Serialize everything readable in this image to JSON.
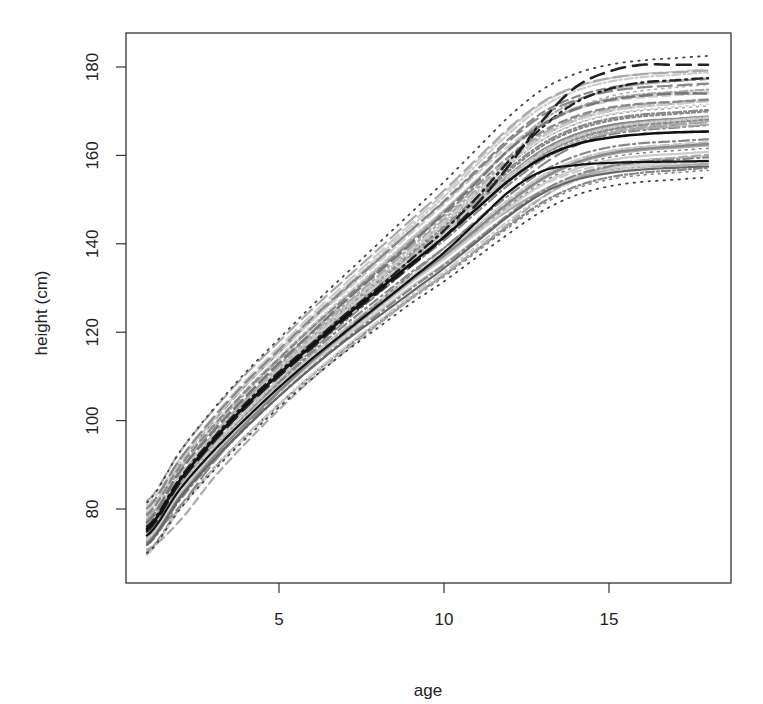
{
  "chart_data": {
    "type": "line",
    "title": "",
    "xlabel": "age",
    "ylabel": "height (cm)",
    "xlim": [
      0.3,
      18.7
    ],
    "ylim": [
      63,
      187
    ],
    "x_ticks": [
      5,
      10,
      15
    ],
    "y_ticks": [
      80,
      100,
      120,
      140,
      160,
      180
    ],
    "x_tick_labels": [
      "5",
      "10",
      "15"
    ],
    "y_tick_labels": [
      "80",
      "100",
      "120",
      "140",
      "160",
      "180"
    ],
    "grid": false,
    "legend": null,
    "x": [
      1,
      2,
      3,
      4,
      5,
      6,
      7,
      8,
      9,
      10,
      11,
      12,
      13,
      14,
      15,
      16,
      17,
      18
    ],
    "series": [
      {
        "name": "upper-dotted",
        "values": [
          81.5,
          93,
          102.5,
          111,
          118.5,
          126,
          133,
          140,
          147,
          154,
          161.5,
          169,
          175,
          178.5,
          180.5,
          181.5,
          182,
          182.5
        ]
      },
      {
        "name": "tall-dashed",
        "values": [
          75,
          86,
          95,
          103,
          110,
          116.5,
          123,
          129,
          135,
          141.5,
          149,
          158,
          168,
          175.5,
          179,
          180.5,
          180.5,
          180.5
        ]
      },
      {
        "name": "tall-dotdash",
        "values": [
          76,
          87,
          96,
          104,
          111,
          117.5,
          124,
          130,
          136.5,
          143,
          150.5,
          159,
          166.5,
          172,
          175,
          176.5,
          177,
          177.5
        ]
      },
      {
        "name": "upper-grey-dashed",
        "values": [
          77,
          88.5,
          97.5,
          105.5,
          113,
          120,
          127,
          133.5,
          140,
          147,
          154,
          161.5,
          167,
          170.5,
          172.5,
          173.5,
          174,
          174
        ]
      },
      {
        "name": "median-black",
        "values": [
          75.5,
          86.5,
          95.5,
          103.5,
          110.5,
          117,
          123.5,
          129.5,
          135.5,
          141.5,
          148,
          154.5,
          159.5,
          162.5,
          164,
          164.8,
          165.2,
          165.4
        ]
      },
      {
        "name": "short-black",
        "values": [
          74,
          84.5,
          93,
          100.5,
          107.5,
          114,
          120,
          126,
          132,
          138,
          145,
          152,
          156.5,
          157.8,
          158.3,
          158.5,
          158.6,
          158.7
        ]
      },
      {
        "name": "lower-grey",
        "values": [
          72,
          82.5,
          91,
          98.5,
          105.5,
          112,
          118,
          123.5,
          129,
          134.5,
          140.5,
          146.5,
          151.5,
          154.5,
          156,
          156.8,
          157.2,
          157.5
        ]
      },
      {
        "name": "lower-dotted",
        "values": [
          70,
          80,
          88.5,
          96,
          103,
          109.5,
          115.5,
          121,
          126.5,
          131.5,
          137,
          142.5,
          147.5,
          151,
          153,
          154,
          154.5,
          155
        ]
      }
    ]
  },
  "style": {
    "axis_color": "#333333",
    "palette": [
      "#111111",
      "#555555",
      "#888888",
      "#aaaaaa",
      "#cccccc"
    ],
    "num_curves": 54
  }
}
